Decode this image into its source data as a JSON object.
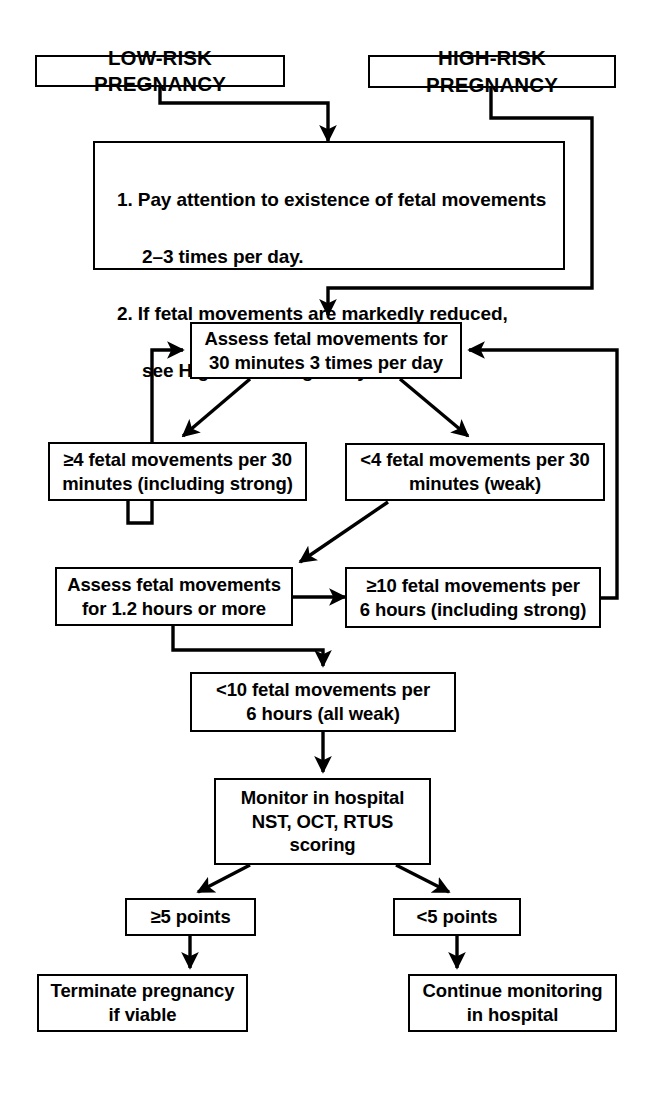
{
  "diagram": {
    "colors": {
      "ink": "#000000",
      "paper": "#ffffff"
    },
    "nodes": {
      "low_risk": {
        "label": "LOW-RISK PREGNANCY"
      },
      "high_risk": {
        "label": "HIGH-RISK PREGNANCY"
      },
      "instructions": {
        "line1": "1. Pay attention to existence of fetal movements",
        "line2": "2–3 times per day.",
        "line3": "2. If fetal movements are markedly reduced,",
        "line4": "see High-Risk Pregnancy."
      },
      "assess_30min": {
        "label": "Assess fetal movements for\n30 minutes 3 times per day"
      },
      "ge4_movements": {
        "label": "≥4 fetal movements per 30\nminutes (including strong)"
      },
      "lt4_movements": {
        "label": "<4 fetal movements per 30\nminutes (weak)"
      },
      "assess_12h": {
        "label": "Assess fetal movements\nfor 1.2 hours or more"
      },
      "ge10_movements": {
        "label": "≥10 fetal movements per\n6 hours (including strong)"
      },
      "lt10_movements": {
        "label": "<10 fetal movements per\n6 hours (all weak)"
      },
      "monitor_hospital": {
        "label": "Monitor in hospital\nNST, OCT, RTUS\nscoring"
      },
      "ge5_points": {
        "label": "≥5 points"
      },
      "lt5_points": {
        "label": "<5 points"
      },
      "terminate": {
        "label": "Terminate pregnancy\nif viable"
      },
      "continue_monitoring": {
        "label": "Continue monitoring\nin hospital"
      }
    },
    "edges": [
      {
        "name": "low-risk-to-instructions",
        "from": "low_risk",
        "to": "instructions"
      },
      {
        "name": "high-risk-to-assess-30min",
        "from": "high_risk",
        "to": "assess_30min"
      },
      {
        "name": "instructions-to-assess-30min",
        "from": "instructions",
        "to": "assess_30min"
      },
      {
        "name": "assess-30min-to-ge4",
        "from": "assess_30min",
        "to": "ge4_movements"
      },
      {
        "name": "assess-30min-to-lt4",
        "from": "assess_30min",
        "to": "lt4_movements"
      },
      {
        "name": "ge4-back-to-assess-30min",
        "from": "ge4_movements",
        "to": "assess_30min"
      },
      {
        "name": "lt4-to-assess-12h",
        "from": "lt4_movements",
        "to": "assess_12h"
      },
      {
        "name": "assess-12h-to-ge10",
        "from": "assess_12h",
        "to": "ge10_movements"
      },
      {
        "name": "ge10-back-to-assess-30min",
        "from": "ge10_movements",
        "to": "assess_30min"
      },
      {
        "name": "assess-12h-to-lt10",
        "from": "assess_12h",
        "to": "lt10_movements"
      },
      {
        "name": "lt10-to-monitor",
        "from": "lt10_movements",
        "to": "monitor_hospital"
      },
      {
        "name": "monitor-to-ge5",
        "from": "monitor_hospital",
        "to": "ge5_points"
      },
      {
        "name": "monitor-to-lt5",
        "from": "monitor_hospital",
        "to": "lt5_points"
      },
      {
        "name": "ge5-to-terminate",
        "from": "ge5_points",
        "to": "terminate"
      },
      {
        "name": "lt5-to-continue",
        "from": "lt5_points",
        "to": "continue_monitoring"
      }
    ]
  }
}
